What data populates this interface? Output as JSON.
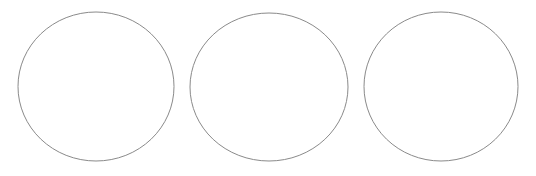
{
  "canvas": {
    "width": 536,
    "height": 176,
    "background_color": "#ffffff",
    "title": "Three empty circles"
  },
  "style": {
    "stroke_color": "#8a8a8a",
    "stroke_width": 1,
    "fill_color": "#ffffff",
    "shape_count": 3
  },
  "shapes": [
    {
      "name": "circle-1",
      "type": "ellipse",
      "cx": 96,
      "cy": 86.5,
      "rx": 78,
      "ry": 74.5,
      "stroke": "#8a8a8a",
      "stroke_width": 1,
      "fill": "#ffffff",
      "label": ""
    },
    {
      "name": "circle-2",
      "type": "ellipse",
      "cx": 269,
      "cy": 87,
      "rx": 79,
      "ry": 74,
      "stroke": "#8a8a8a",
      "stroke_width": 1,
      "fill": "#ffffff",
      "label": ""
    },
    {
      "name": "circle-3",
      "type": "ellipse",
      "cx": 441,
      "cy": 86.5,
      "rx": 77,
      "ry": 74.5,
      "stroke": "#8a8a8a",
      "stroke_width": 1,
      "fill": "#ffffff",
      "label": ""
    }
  ]
}
